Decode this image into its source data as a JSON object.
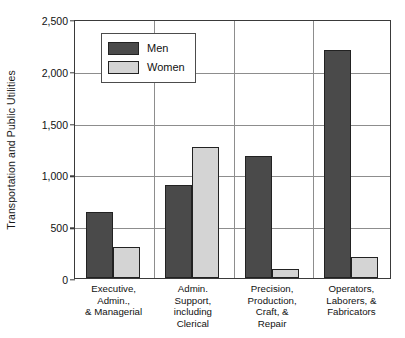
{
  "chart_data": {
    "type": "bar",
    "title": "",
    "xlabel": "",
    "ylabel": "Transportation and Public Utilities",
    "ylim": [
      0,
      2500
    ],
    "yticks": [
      "0",
      "500",
      "1,000",
      "1,500",
      "2,000",
      "2,500"
    ],
    "ytick_values": [
      0,
      500,
      1000,
      1500,
      2000,
      2500
    ],
    "grid": true,
    "legend_position": "upper-left-inside",
    "categories": [
      "Executive, Admin., & Managerial",
      "Admin. Support, including Clerical",
      "Precision, Production, Craft, & Repair",
      "Operators, Laborers, & Fabricators"
    ],
    "category_lines": [
      [
        "Executive,",
        "Admin.,",
        "& Managerial"
      ],
      [
        "Admin.",
        "Support,",
        "including",
        "Clerical"
      ],
      [
        "Precision,",
        "Production,",
        "Craft, &",
        "Repair"
      ],
      [
        "Operators,",
        "Laborers, &",
        "Fabricators"
      ]
    ],
    "series": [
      {
        "name": "Men",
        "color": "#4a4a4a",
        "values": [
          640,
          900,
          1180,
          2200
        ]
      },
      {
        "name": "Women",
        "color": "#d4d4d4",
        "values": [
          300,
          1260,
          85,
          205
        ]
      }
    ]
  },
  "legend": {
    "items": [
      {
        "label": "Men",
        "swatch": "men"
      },
      {
        "label": "Women",
        "swatch": "women"
      }
    ]
  },
  "colors": {
    "men_bar": "#4a4a4a",
    "women_bar": "#d4d4d4",
    "axis": "#3a3a3a",
    "gridline": "#8d8d8d",
    "text": "#111111",
    "background": "#ffffff"
  }
}
